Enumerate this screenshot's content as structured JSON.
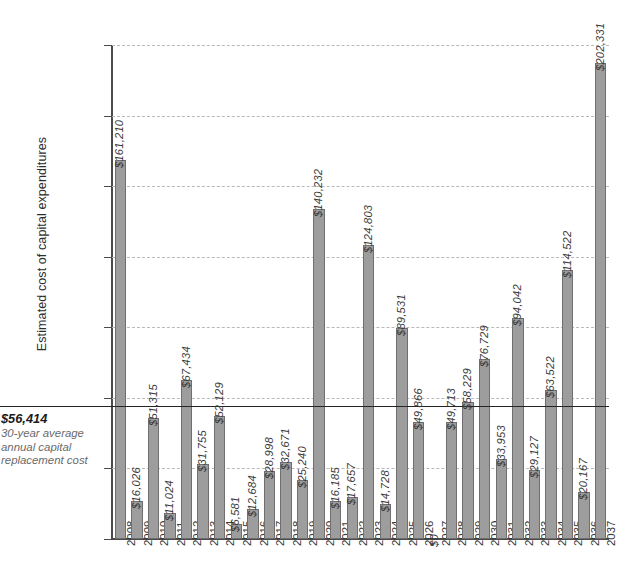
{
  "chart_data": {
    "type": "bar",
    "title": "",
    "xlabel": "",
    "ylabel": "Estimated cost of capital expenditures",
    "ylim": [
      0,
      210000
    ],
    "ytick_labels": [
      "$0",
      "$30,000",
      "$60,000",
      "$90,000",
      "$120,000",
      "$150,000",
      "$180,000",
      "$210,000"
    ],
    "ytick_values": [
      0,
      30000,
      60000,
      90000,
      120000,
      150000,
      180000,
      210000
    ],
    "grid": true,
    "legend": "none",
    "categories": [
      "2008",
      "2009",
      "2010",
      "2011",
      "2012",
      "2013",
      "2014",
      "2015",
      "2016",
      "2017",
      "2018",
      "2019",
      "2020",
      "2021",
      "2022",
      "2023",
      "2024",
      "2025",
      "2026",
      "2027",
      "2028",
      "2029",
      "2030",
      "2031",
      "2032",
      "2033",
      "2034",
      "2035",
      "2036",
      "2037"
    ],
    "values": [
      161210,
      16026,
      51315,
      11024,
      67434,
      31755,
      52129,
      6581,
      12684,
      28998,
      32671,
      25240,
      140232,
      16185,
      17657,
      124803,
      14728,
      89531,
      49866,
      0,
      49713,
      58229,
      76729,
      33953,
      94042,
      29127,
      63522,
      114522,
      20167,
      202331
    ],
    "value_labels": [
      "$161,210",
      "$16,026",
      "$51,315",
      "$11,024",
      "$67,434",
      "$31,755",
      "$52,129",
      "$6,581",
      "$12,684",
      "$28,998",
      "$32,671",
      "$25,240",
      "$140,232",
      "$16,185",
      "$17,657",
      "$124,803",
      "$14,728",
      "$89,531",
      "$49,866",
      "$0",
      "$49,713",
      "$58,229",
      "$76,729",
      "$33,953",
      "$94,042",
      "$29,127",
      "$63,522",
      "$114,522",
      "$20,167",
      "$202,331"
    ],
    "annotations": [
      {
        "name": "average-reference-line",
        "value": 56414,
        "value_label": "$56,414",
        "description_lines": [
          "30-year average",
          "annual capital",
          "replacement cost"
        ]
      }
    ],
    "colors": {
      "bar_fill": "#9d9d9d",
      "bar_stroke": "#6f6f6f",
      "gridline": "#b9b9b9",
      "axis": "#4a4a4a",
      "average_line": "#242424",
      "text": "#3a3a3a"
    }
  }
}
